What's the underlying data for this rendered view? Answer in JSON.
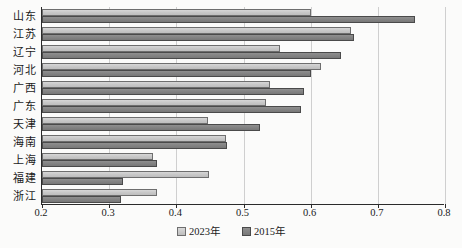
{
  "chart_data": {
    "type": "bar",
    "orientation": "horizontal",
    "title": "",
    "xlabel": "",
    "ylabel": "",
    "xlim": [
      0.2,
      0.8
    ],
    "xticks": [
      "0.2",
      "0.3",
      "0.4",
      "0.5",
      "0.6",
      "0.7",
      "0.8"
    ],
    "grid": true,
    "legend_position": "bottom-center",
    "categories": [
      "山东",
      "江苏",
      "辽宁",
      "河北",
      "广西",
      "广东",
      "天津",
      "海南",
      "上海",
      "福建",
      "浙江"
    ],
    "series": [
      {
        "name": "2023年",
        "color": "#c9c9c9",
        "values": [
          0.6,
          0.66,
          0.555,
          0.615,
          0.54,
          0.534,
          0.447,
          0.474,
          0.366,
          0.449,
          0.371
        ]
      },
      {
        "name": "2015年",
        "color": "#848484",
        "values": [
          0.756,
          0.665,
          0.645,
          0.6,
          0.59,
          0.586,
          0.525,
          0.476,
          0.371,
          0.32,
          0.318
        ]
      }
    ]
  },
  "legend": {
    "items": [
      {
        "label": "2023年",
        "swatch": "light"
      },
      {
        "label": "2015年",
        "swatch": "dark"
      }
    ]
  },
  "axis": {
    "tick_labels": [
      "0.2",
      "0.3",
      "0.4",
      "0.5",
      "0.6",
      "0.7",
      "0.8"
    ]
  }
}
